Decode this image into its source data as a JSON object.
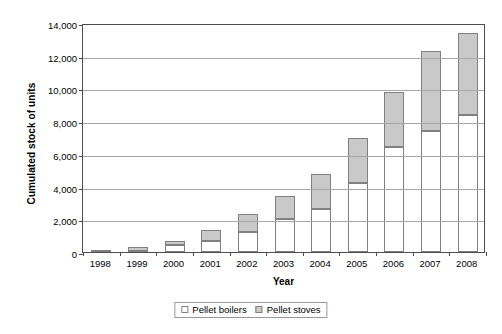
{
  "chart_data": {
    "type": "bar",
    "subtype": "stacked-vertical",
    "title": "",
    "xlabel": "Year",
    "ylabel": "Cumulated stock of units",
    "categories": [
      "1998",
      "1999",
      "2000",
      "2001",
      "2002",
      "2003",
      "2004",
      "2005",
      "2006",
      "2007",
      "2008"
    ],
    "series": [
      {
        "name": "Pellet boilers",
        "color": "#ffffff",
        "values": [
          20,
          60,
          400,
          700,
          1250,
          2000,
          2600,
          4200,
          6400,
          7400,
          8400
        ]
      },
      {
        "name": "Pellet stoves",
        "color": "#c9c9c9",
        "values": [
          130,
          260,
          280,
          650,
          1050,
          1400,
          2150,
          2800,
          3400,
          4900,
          5000
        ]
      }
    ],
    "totals": [
      150,
      320,
      680,
      1350,
      2300,
      3400,
      4750,
      7000,
      9800,
      12300,
      13400
    ],
    "ylim": [
      0,
      14000
    ],
    "ytick_step": 2000,
    "ytick_labels": [
      "0",
      "2,000",
      "4,000",
      "6,000",
      "8,000",
      "10,000",
      "12,000",
      "14,000"
    ],
    "ytick_values": [
      0,
      2000,
      4000,
      6000,
      8000,
      10000,
      12000,
      14000
    ],
    "grid": true,
    "grid_axis": "y",
    "legend_position": "bottom-center",
    "legend_entries": [
      "Pellet boilers",
      "Pellet stoves"
    ],
    "axis_color": "#4d4d4d",
    "gridline_color": "#a6a6a6",
    "bar_border_color": "#808080"
  }
}
